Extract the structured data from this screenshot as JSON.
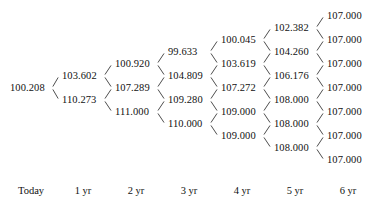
{
  "chart_data": {
    "type": "diagram",
    "diagram_type": "recombining-binomial-tree",
    "title": "",
    "xlabel": "",
    "ylabel": "",
    "grid": false,
    "legend": null,
    "period_labels": [
      "Today",
      "1 yr",
      "2 yr",
      "3 yr",
      "4 yr",
      "5 yr",
      "6 yr"
    ],
    "columns": [
      {
        "label": "Today",
        "values": [
          "100.208"
        ]
      },
      {
        "label": "1 yr",
        "values": [
          "103.602",
          "110.273"
        ]
      },
      {
        "label": "2 yr",
        "values": [
          "100.920",
          "107.289",
          "111.000"
        ]
      },
      {
        "label": "3 yr",
        "values": [
          "99.633",
          "104.809",
          "109.280",
          "110.000"
        ]
      },
      {
        "label": "4 yr",
        "values": [
          "100.045",
          "103.619",
          "107.272",
          "109.000",
          "109.000"
        ]
      },
      {
        "label": "5 yr",
        "values": [
          "102.382",
          "104.260",
          "106.176",
          "108.000",
          "108.000",
          "108.000"
        ]
      },
      {
        "label": "6 yr",
        "values": [
          "107.000",
          "107.000",
          "107.000",
          "107.000",
          "107.000",
          "107.000",
          "107.000"
        ]
      }
    ],
    "node_values_flat": [
      "100.208",
      "103.602",
      "110.273",
      "100.920",
      "107.289",
      "111.000",
      "99.633",
      "104.809",
      "109.280",
      "110.000",
      "100.045",
      "103.619",
      "107.272",
      "109.000",
      "109.000",
      "102.382",
      "104.260",
      "106.176",
      "108.000",
      "108.000",
      "108.000",
      "107.000",
      "107.000",
      "107.000",
      "107.000",
      "107.000",
      "107.000",
      "107.000"
    ]
  },
  "style": {
    "background": "#ffffff",
    "text_color": "#111111",
    "line_color": "#3a3a3a"
  }
}
